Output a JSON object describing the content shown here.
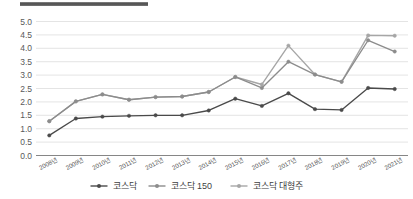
{
  "title_bar": {
    "present": true,
    "color": "#5a5a5a"
  },
  "chart_data": {
    "type": "line",
    "title": "",
    "subtitle": "",
    "xlabel": "",
    "ylabel": "",
    "categories": [
      "2008년",
      "2009년",
      "2010년",
      "2011년",
      "2012년",
      "2013년",
      "2014년",
      "2015년",
      "2016년",
      "2017년",
      "2018년",
      "2019년",
      "2020년",
      "2021년"
    ],
    "ylim": [
      0.0,
      5.0
    ],
    "ytick_values": [
      0.0,
      0.5,
      1.0,
      1.5,
      2.0,
      2.5,
      3.0,
      3.5,
      4.0,
      4.5,
      5.0
    ],
    "ytick_labels": [
      "0.0",
      "0.5",
      "1.0",
      "1.5",
      "2.0",
      "2.5",
      "3.0",
      "3.5",
      "4.0",
      "4.5",
      "5.0"
    ],
    "grid": true,
    "legend_position": "bottom",
    "series": [
      {
        "name": "코스닥",
        "color": "#4a4a4a",
        "marker": "circle",
        "values": [
          0.75,
          1.38,
          1.45,
          1.48,
          1.5,
          1.5,
          1.68,
          2.12,
          1.85,
          2.32,
          1.73,
          1.7,
          2.52,
          2.48
        ]
      },
      {
        "name": "코스닥 150",
        "color": "#8c8c8c",
        "marker": "circle",
        "values": [
          1.28,
          2.02,
          2.28,
          2.08,
          2.18,
          2.2,
          2.37,
          2.93,
          2.52,
          3.5,
          3.02,
          2.75,
          4.3,
          3.88
        ]
      },
      {
        "name": "코스닥 대형주",
        "color": "#a6a6a6",
        "marker": "circle",
        "values": [
          1.28,
          2.02,
          2.28,
          2.08,
          2.18,
          2.2,
          2.37,
          2.93,
          2.65,
          4.1,
          3.02,
          2.75,
          4.48,
          4.47
        ]
      }
    ]
  },
  "legend": {
    "items": [
      {
        "label": "코스닥",
        "color": "#4a4a4a"
      },
      {
        "label": "코스닥 150",
        "color": "#8c8c8c"
      },
      {
        "label": "코스닥 대형주",
        "color": "#a6a6a6"
      }
    ]
  }
}
